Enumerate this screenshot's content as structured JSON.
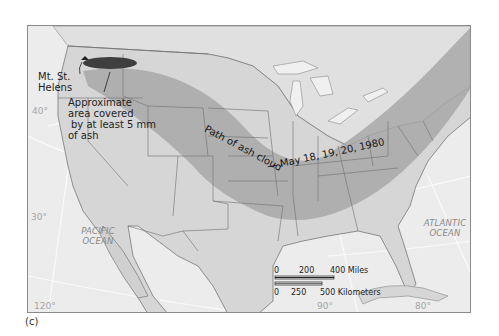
{
  "figure": {
    "caption": "(c)"
  },
  "map": {
    "colors": {
      "ocean": "#ececec",
      "land_us": "#d6d6d6",
      "land_other": "#e0e0e0",
      "ash_path": "#a8a8a8",
      "ash_5mm": "#3f3f3f",
      "lakes": "#f0f0f0",
      "borders": "#6e6e6e",
      "graticule": "#ffffff"
    },
    "labels": {
      "volcano": [
        "Mt. St.",
        "Helens"
      ],
      "ash_area": [
        "Approximate",
        "area covered",
        "by at least 5 mm",
        "of ash"
      ],
      "path_part1": "Path of ash cloud",
      "path_part2": "— May 18, 19, 20, 1980"
    },
    "oceans": {
      "pacific": [
        "PACIFIC",
        "OCEAN"
      ],
      "atlantic": [
        "ATLANTIC",
        "OCEAN"
      ]
    },
    "graticule": {
      "lat_40": "40°",
      "lat_30": "30°",
      "lon_120": "120°",
      "lon_90": "90°",
      "lon_80": "80°"
    },
    "scale_bar": {
      "miles_ticks": [
        "0",
        "200",
        "400 Miles"
      ],
      "km_ticks": [
        "0",
        "250",
        "500 Kilometers"
      ]
    }
  }
}
